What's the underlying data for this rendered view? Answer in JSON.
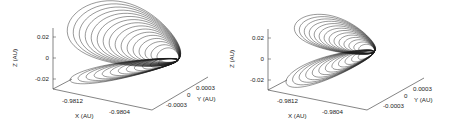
{
  "chart_data": [
    {
      "type": "line",
      "subtype": "3d-trajectory",
      "title": "",
      "xlabel": "X (AU)",
      "ylabel": "Y (AU)",
      "zlabel": "Z (AU)",
      "x_ticks": [
        "-0.9812",
        "-0.9804"
      ],
      "y_ticks": [
        "0.0003",
        "0",
        "-0.0003"
      ],
      "z_ticks": [
        "0.02",
        "0",
        "-0.02"
      ],
      "xlim": [
        -0.9816,
        -0.98
      ],
      "ylim": [
        -0.0004,
        0.0004
      ],
      "zlim": [
        -0.03,
        0.03
      ],
      "description": "Nested looping trajectory: upper lobe reaching Z≈+0.03 and lower lobe reaching Z≈-0.02, converging near X≈-0.9804, Y≈0",
      "series": [
        {
          "name": "upper-lobe",
          "loops": 16,
          "z_max": 0.03,
          "z_min": 0.0
        },
        {
          "name": "lower-lobe",
          "loops": 12,
          "z_max": 0.0,
          "z_min": -0.02
        }
      ],
      "color": "#1a1a1a"
    },
    {
      "type": "line",
      "subtype": "3d-trajectory",
      "title": "",
      "xlabel": "X (AU)",
      "ylabel": "Y (AU)",
      "zlabel": "Z (AU)",
      "x_ticks": [
        "-0.9812",
        "-0.9804"
      ],
      "y_ticks": [
        "0.0003",
        "0",
        "-0.0003"
      ],
      "z_ticks": [
        "0.02",
        "0",
        "-0.02"
      ],
      "xlim": [
        -0.9816,
        -0.98
      ],
      "ylim": [
        -0.0004,
        0.0004
      ],
      "zlim": [
        -0.03,
        0.03
      ],
      "description": "Nested looping trajectory with narrower upper lobe and elongated lower lobe, crossing near X≈-0.9804, Y≈0",
      "series": [
        {
          "name": "upper-lobe",
          "loops": 14,
          "z_max": 0.03,
          "z_min": 0.0
        },
        {
          "name": "lower-lobe",
          "loops": 12,
          "z_max": 0.0,
          "z_min": -0.02
        }
      ],
      "color": "#1a1a1a"
    }
  ]
}
